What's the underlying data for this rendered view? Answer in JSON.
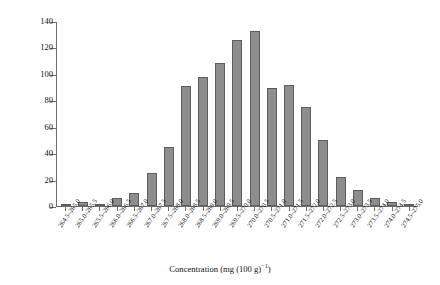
{
  "chart_data": {
    "type": "bar",
    "title": "",
    "xlabel": "Concentration (mg (100 g)−1)",
    "ylabel": "Frequency",
    "ylim": [
      0,
      140
    ],
    "yticks": [
      0,
      20,
      40,
      60,
      80,
      100,
      120,
      140
    ],
    "grid": false,
    "legend": "none",
    "categories": [
      "264.5–265.0",
      "265.0–265.5",
      "265.5–266.0",
      "266.0–266.5",
      "266.5–267.0",
      "267.0–267.5",
      "267.5–268.0",
      "268.0–268.5",
      "268.5–269.0",
      "269.0–269.5",
      "269.5–270.0",
      "270.0–270.5",
      "270.5–271.0",
      "271.0–271.5",
      "271.5–272.0",
      "272.0–272.5",
      "272.5–273.0",
      "273.0–273.5",
      "273.5–274.0",
      "274.0–274.5",
      "274.5–275.0"
    ],
    "values": [
      1,
      3,
      1,
      6,
      10,
      25,
      45,
      91,
      98,
      109,
      126,
      133,
      90,
      92,
      75,
      50,
      22,
      12,
      6,
      3,
      1
    ],
    "bar_color": "#8d8d8d",
    "bar_edge_color": "#5d5d5d",
    "axis_color": "#6e6e6e"
  },
  "axis": {
    "x_title_main": "Concentration (mg (100 g)",
    "x_title_sup": "−1",
    "x_title_tail": ")",
    "y_title": "Frequency"
  }
}
